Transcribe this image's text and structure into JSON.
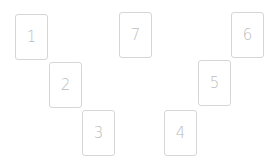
{
  "colors": {
    "background": "#ffffff",
    "card_border": "#d6d6d6",
    "card_text": "#bdbdbd"
  },
  "cards": [
    {
      "label": "1",
      "x": 15,
      "y": 14
    },
    {
      "label": "2",
      "x": 49,
      "y": 62
    },
    {
      "label": "3",
      "x": 82,
      "y": 110
    },
    {
      "label": "4",
      "x": 164,
      "y": 110
    },
    {
      "label": "5",
      "x": 198,
      "y": 60
    },
    {
      "label": "6",
      "x": 231,
      "y": 12
    },
    {
      "label": "7",
      "x": 119,
      "y": 12
    }
  ]
}
